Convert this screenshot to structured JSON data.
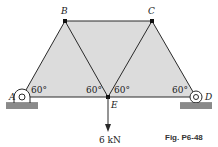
{
  "diagram": {
    "figure_label": "Fig. P6-48",
    "nodes": {
      "A": "A",
      "B": "B",
      "C": "C",
      "D": "D",
      "E": "E"
    },
    "angles": {
      "at_A": "60°",
      "at_E_left": "60°",
      "at_E_right": "60°",
      "at_D": "60°"
    },
    "load": {
      "label": "6 kN",
      "node": "E",
      "direction": "down"
    },
    "members": [
      "AB",
      "BC",
      "CD",
      "AE",
      "ED",
      "BE",
      "CE"
    ],
    "supports": [
      "A: pin",
      "D: roller"
    ],
    "colors": {
      "fill": "#dcdcdc",
      "line": "#2a2a2a",
      "ground": "#8a8a8a"
    }
  }
}
